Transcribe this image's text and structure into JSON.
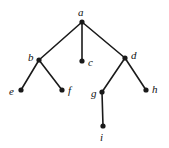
{
  "figure": {
    "type": "rooted-tree-diagram",
    "background_color": "#ffffff",
    "ink_color": "#1a1a1a",
    "width": 169,
    "height": 148,
    "edge_width": 1.6,
    "node_radius": 2.6
  },
  "nodes": [
    {
      "id": "a",
      "label": "a",
      "x": 82,
      "y": 22,
      "label_x": 78,
      "label_y": 7,
      "label_position": "above"
    },
    {
      "id": "b",
      "label": "b",
      "x": 39,
      "y": 60,
      "label_x": 28,
      "label_y": 52,
      "label_position": "left"
    },
    {
      "id": "c",
      "label": "c",
      "x": 82,
      "y": 61,
      "label_x": 88,
      "label_y": 57,
      "label_position": "right"
    },
    {
      "id": "d",
      "label": "d",
      "x": 125,
      "y": 58,
      "label_x": 131,
      "label_y": 50,
      "label_position": "right"
    },
    {
      "id": "e",
      "label": "e",
      "x": 21,
      "y": 90,
      "label_x": 9,
      "label_y": 86,
      "label_position": "left"
    },
    {
      "id": "f",
      "label": "f",
      "x": 62,
      "y": 90,
      "label_x": 68,
      "label_y": 85,
      "label_position": "right"
    },
    {
      "id": "g",
      "label": "g",
      "x": 102,
      "y": 92,
      "label_x": 91,
      "label_y": 88,
      "label_position": "left"
    },
    {
      "id": "h",
      "label": "h",
      "x": 146,
      "y": 90,
      "label_x": 152,
      "label_y": 84,
      "label_position": "right"
    },
    {
      "id": "i",
      "label": "i",
      "x": 103,
      "y": 126,
      "label_x": 100,
      "label_y": 132,
      "label_position": "below"
    }
  ],
  "edges": [
    {
      "id": "a-b",
      "from": "a",
      "to": "b"
    },
    {
      "id": "a-c",
      "from": "a",
      "to": "c"
    },
    {
      "id": "a-d",
      "from": "a",
      "to": "d"
    },
    {
      "id": "b-e",
      "from": "b",
      "to": "e"
    },
    {
      "id": "b-f",
      "from": "b",
      "to": "f"
    },
    {
      "id": "d-g",
      "from": "d",
      "to": "g"
    },
    {
      "id": "d-h",
      "from": "d",
      "to": "h"
    },
    {
      "id": "g-i",
      "from": "g",
      "to": "i"
    }
  ]
}
